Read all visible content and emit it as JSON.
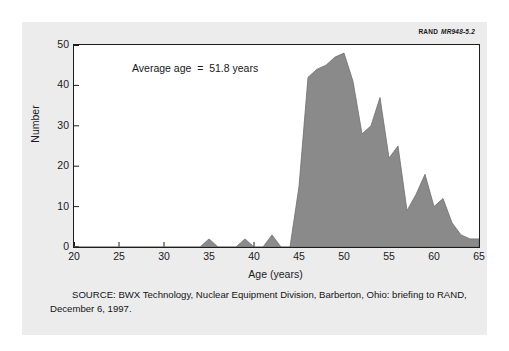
{
  "credit": {
    "organization": "RAND",
    "document_id": "MR948-5.2"
  },
  "annotation": {
    "average_age": "Average age  =  51.8 years"
  },
  "source_note": {
    "line1": "SOURCE:  BWX Technology, Nuclear Equipment Division, Barberton, Ohio:  briefing",
    "line2": "to RAND, December 6, 1997."
  },
  "colors": {
    "area_fill": "#8a8a8a",
    "area_stroke": "#6f6f6f",
    "axis": "#1d1d1f",
    "card_background": "#ececed",
    "plot_background": "#ffffff",
    "text": "#1b1b1d"
  },
  "chart_data": {
    "type": "area",
    "title": "",
    "xlabel": "Age (years)",
    "ylabel": "Number",
    "xlim": [
      20,
      65
    ],
    "ylim": [
      0,
      50
    ],
    "grid": false,
    "legend": null,
    "xticks": [
      20,
      25,
      30,
      35,
      40,
      45,
      50,
      55,
      60,
      65
    ],
    "yticks": [
      0,
      10,
      20,
      30,
      40,
      50
    ],
    "annotations": [
      "Average age  =  51.8 years"
    ],
    "x": [
      20,
      21,
      22,
      23,
      24,
      25,
      26,
      27,
      28,
      29,
      30,
      31,
      32,
      33,
      34,
      35,
      36,
      37,
      38,
      39,
      40,
      41,
      42,
      43,
      44,
      45,
      46,
      47,
      48,
      49,
      50,
      51,
      52,
      53,
      54,
      55,
      56,
      57,
      58,
      59,
      60,
      61,
      62,
      63,
      64,
      65
    ],
    "values": [
      0,
      0,
      0,
      0,
      0,
      0,
      0,
      0,
      0,
      0,
      0,
      0,
      0,
      0,
      0,
      2,
      0,
      0,
      0,
      2,
      0,
      0,
      3,
      0,
      0,
      15,
      42,
      44,
      45,
      47,
      48,
      41,
      28,
      30,
      37,
      22,
      25,
      9,
      13,
      18,
      10,
      12,
      6,
      3,
      2,
      2
    ],
    "series": [
      {
        "name": "Number of workers",
        "values": [
          0,
          0,
          0,
          0,
          0,
          0,
          0,
          0,
          0,
          0,
          0,
          0,
          0,
          0,
          0,
          2,
          0,
          0,
          0,
          2,
          0,
          0,
          3,
          0,
          0,
          15,
          42,
          44,
          45,
          47,
          48,
          41,
          28,
          30,
          37,
          22,
          25,
          9,
          13,
          18,
          10,
          12,
          6,
          3,
          2,
          2
        ]
      }
    ]
  }
}
